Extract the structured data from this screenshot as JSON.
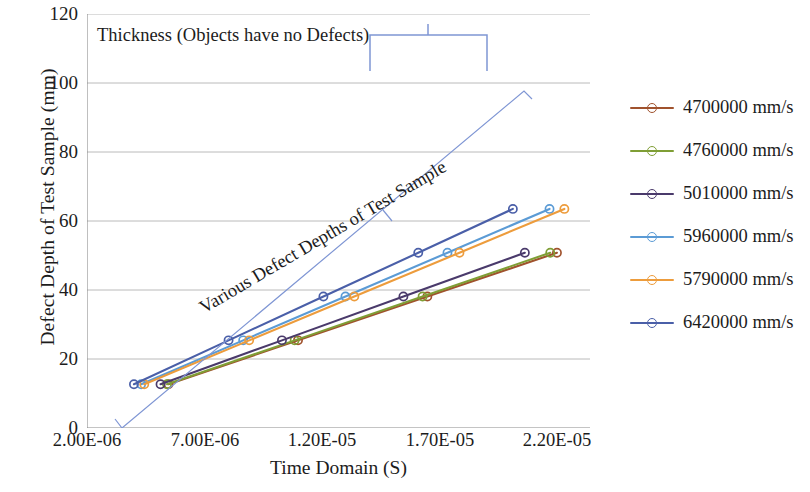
{
  "chart_data": {
    "type": "line",
    "title": "",
    "xlabel": "Time Domain (S)",
    "ylabel": "Defect Depth of Test Sample (mm)",
    "xtick_labels": [
      "2.00E-06",
      "7.00E-06",
      "1.20E-05",
      "1.70E-05",
      "2.20E-05"
    ],
    "xtick_values": [
      2e-06,
      7e-06,
      1.2e-05,
      1.7e-05,
      2.2e-05
    ],
    "ytick_labels": [
      "0",
      "20",
      "40",
      "60",
      "80",
      "100",
      "120"
    ],
    "ytick_values": [
      0,
      20,
      40,
      60,
      80,
      100,
      120
    ],
    "xlim": [
      2e-06,
      2.3e-05
    ],
    "ylim": [
      0,
      120
    ],
    "grid": "horizontal",
    "legend_position": "right",
    "marker": "open-circle",
    "series": [
      {
        "name": "4700000 mm/s",
        "color": "#a0522d",
        "x": [
          5.4e-06,
          1.081e-05,
          1.621e-05,
          2.162e-05,
          2.702e-05,
          3.243e-05,
          3.783e-05,
          4.324e-05
        ],
        "values": [
          12.7,
          25.4,
          38.1,
          50.8,
          63.5,
          76.2,
          88.9,
          101.6
        ]
      },
      {
        "name": "4760000 mm/s",
        "color": "#7f9e35",
        "x": [
          5.34e-06,
          1.067e-05,
          1.601e-05,
          2.134e-05,
          2.668e-05,
          3.202e-05,
          3.735e-05,
          4.269e-05
        ],
        "values": [
          12.7,
          25.4,
          38.1,
          50.8,
          63.5,
          76.2,
          88.9,
          101.6
        ]
      },
      {
        "name": "5010000 mm/s",
        "color": "#4a3a6b",
        "x": [
          5.07e-06,
          1.014e-05,
          1.521e-05,
          2.028e-05,
          2.535e-05,
          3.042e-05,
          3.549e-05,
          4.056e-05
        ],
        "values": [
          12.7,
          25.4,
          38.1,
          50.8,
          63.5,
          76.2,
          88.9,
          101.6
        ]
      },
      {
        "name": "5960000 mm/s",
        "color": "#5b9bd5",
        "x": [
          4.26e-06,
          8.52e-06,
          1.279e-05,
          1.705e-05,
          2.131e-05,
          2.557e-05,
          2.983e-05,
          3.409e-05
        ],
        "values": [
          12.7,
          25.4,
          38.1,
          50.8,
          63.5,
          76.2,
          88.9,
          101.6
        ]
      },
      {
        "name": "5790000 mm/s",
        "color": "#ed9c3c",
        "x": [
          4.39e-06,
          8.77e-06,
          1.316e-05,
          1.755e-05,
          2.193e-05,
          2.632e-05,
          3.071e-05,
          3.509e-05
        ],
        "values": [
          12.7,
          25.4,
          38.1,
          50.8,
          63.5,
          76.2,
          88.9,
          101.6
        ]
      },
      {
        "name": "6420000 mm/s",
        "color": "#4a5fa8",
        "x": [
          3.96e-06,
          7.91e-06,
          1.187e-05,
          1.583e-05,
          1.978e-05,
          2.374e-05,
          2.77e-05,
          3.165e-05
        ],
        "values": [
          12.7,
          25.4,
          38.1,
          50.8,
          63.5,
          76.2,
          88.9,
          101.6
        ]
      }
    ],
    "annotations": [
      {
        "text": "Thickness (Objects have no Defects)",
        "kind": "brace-label-top"
      },
      {
        "text": "Various Defect Depths of Test Sample",
        "kind": "brace-label-diagonal"
      }
    ]
  },
  "annotation_colors": {
    "brace": "#7f96d4",
    "grid": "#9a9a9a",
    "axis": "#8a8a8a"
  }
}
